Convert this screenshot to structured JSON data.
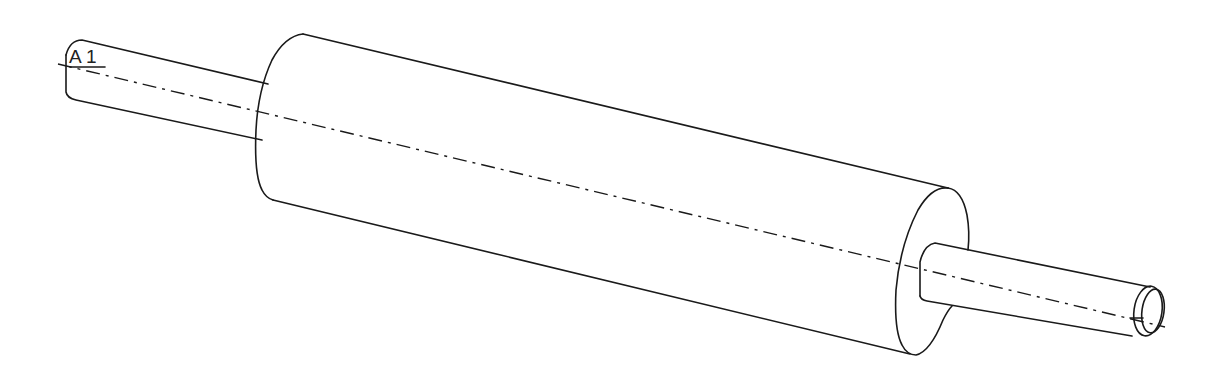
{
  "drawing": {
    "title": "Shaft with cylindrical roller (isometric line drawing)",
    "axis_label": "A_1",
    "label_text": "A 1",
    "colors": {
      "line": "#1a1a1a",
      "background": "#ffffff"
    },
    "parts": [
      {
        "name": "left-shaft",
        "description": "small-diameter left shaft end"
      },
      {
        "name": "main-cylinder",
        "description": "large-diameter central roller body"
      },
      {
        "name": "right-shaft",
        "description": "small-diameter right shaft end with chamfer"
      },
      {
        "name": "center-axis",
        "description": "dash-dot centerline through the axis"
      }
    ]
  }
}
